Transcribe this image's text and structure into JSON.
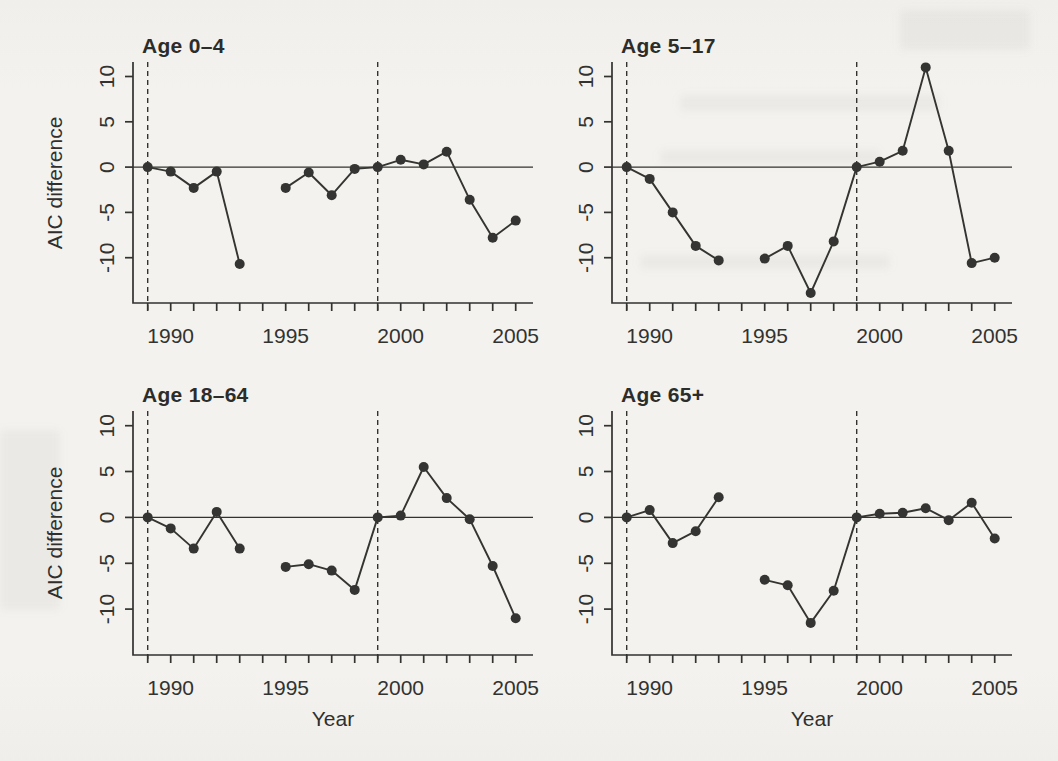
{
  "figure": {
    "ylabel": "AIC difference",
    "xlabel": "Year",
    "paper_color": "#f3f2ee",
    "ink_color": "#323230",
    "point_color": "#343432"
  },
  "chart_data": [
    {
      "type": "line",
      "title": "Age 0–4",
      "x": [
        1989,
        1990,
        1991,
        1992,
        1993,
        1994,
        1995,
        1996,
        1997,
        1998,
        1999,
        2000,
        2001,
        2002,
        2003,
        2004,
        2005
      ],
      "values": [
        0,
        -0.5,
        -2.3,
        -0.5,
        -10.7,
        null,
        -2.3,
        -0.6,
        -3.1,
        -0.2,
        0,
        0.8,
        0.3,
        1.7,
        -3.6,
        -7.8,
        -5.9
      ],
      "xlim": [
        1988.36,
        2005.75
      ],
      "ylim": [
        -15.0,
        11.6
      ],
      "x_ticks": [
        1989,
        1990,
        1991,
        1992,
        1993,
        1994,
        1995,
        1996,
        1997,
        1998,
        1999,
        2000,
        2001,
        2002,
        2003,
        2004,
        2005
      ],
      "x_tick_labels": [
        {
          "value": 1990,
          "label": "1990"
        },
        {
          "value": 1995,
          "label": "1995"
        },
        {
          "value": 2000,
          "label": "2000"
        },
        {
          "value": 2005,
          "label": "2005"
        }
      ],
      "y_ticks": [
        {
          "value": 10,
          "label": "10"
        },
        {
          "value": 5,
          "label": "5"
        },
        {
          "value": 0,
          "label": "0"
        },
        {
          "value": -5,
          "label": "-5"
        },
        {
          "value": -10,
          "label": "-10"
        }
      ],
      "vlines_dashed": [
        1989,
        1999
      ],
      "hline": 0,
      "grid": "off",
      "legend": "none"
    },
    {
      "type": "line",
      "title": "Age 5–17",
      "x": [
        1989,
        1990,
        1991,
        1992,
        1993,
        1994,
        1995,
        1996,
        1997,
        1998,
        1999,
        2000,
        2001,
        2002,
        2003,
        2004,
        2005
      ],
      "values": [
        0,
        -1.3,
        -5.0,
        -8.7,
        -10.3,
        null,
        -10.1,
        -8.7,
        -13.9,
        -8.2,
        0,
        0.6,
        1.8,
        11.0,
        1.8,
        -10.6,
        -10.0
      ],
      "xlim": [
        1988.36,
        2005.75
      ],
      "ylim": [
        -15.0,
        11.6
      ],
      "x_ticks": [
        1989,
        1990,
        1991,
        1992,
        1993,
        1994,
        1995,
        1996,
        1997,
        1998,
        1999,
        2000,
        2001,
        2002,
        2003,
        2004,
        2005
      ],
      "x_tick_labels": [
        {
          "value": 1990,
          "label": "1990"
        },
        {
          "value": 1995,
          "label": "1995"
        },
        {
          "value": 2000,
          "label": "2000"
        },
        {
          "value": 2005,
          "label": "2005"
        }
      ],
      "y_ticks": [
        {
          "value": 10,
          "label": "10"
        },
        {
          "value": 5,
          "label": "5"
        },
        {
          "value": 0,
          "label": "0"
        },
        {
          "value": -5,
          "label": "-5"
        },
        {
          "value": -10,
          "label": "-10"
        }
      ],
      "vlines_dashed": [
        1989,
        1999
      ],
      "hline": 0,
      "grid": "off",
      "legend": "none"
    },
    {
      "type": "line",
      "title": "Age 18–64",
      "x": [
        1989,
        1990,
        1991,
        1992,
        1993,
        1994,
        1995,
        1996,
        1997,
        1998,
        1999,
        2000,
        2001,
        2002,
        2003,
        2004,
        2005
      ],
      "values": [
        0,
        -1.2,
        -3.4,
        0.6,
        -3.4,
        null,
        -5.4,
        -5.1,
        -5.8,
        -7.9,
        0,
        0.2,
        5.5,
        2.1,
        -0.2,
        -5.3,
        -11.0
      ],
      "xlim": [
        1988.36,
        2005.75
      ],
      "ylim": [
        -15.0,
        11.6
      ],
      "x_ticks": [
        1989,
        1990,
        1991,
        1992,
        1993,
        1994,
        1995,
        1996,
        1997,
        1998,
        1999,
        2000,
        2001,
        2002,
        2003,
        2004,
        2005
      ],
      "x_tick_labels": [
        {
          "value": 1990,
          "label": "1990"
        },
        {
          "value": 1995,
          "label": "1995"
        },
        {
          "value": 2000,
          "label": "2000"
        },
        {
          "value": 2005,
          "label": "2005"
        }
      ],
      "y_ticks": [
        {
          "value": 10,
          "label": "10"
        },
        {
          "value": 5,
          "label": "5"
        },
        {
          "value": 0,
          "label": "0"
        },
        {
          "value": -5,
          "label": "-5"
        },
        {
          "value": -10,
          "label": "-10"
        }
      ],
      "vlines_dashed": [
        1989,
        1999
      ],
      "hline": 0,
      "grid": "off",
      "legend": "none"
    },
    {
      "type": "line",
      "title": "Age 65+",
      "x": [
        1989,
        1990,
        1991,
        1992,
        1993,
        1994,
        1995,
        1996,
        1997,
        1998,
        1999,
        2000,
        2001,
        2002,
        2003,
        2004,
        2005
      ],
      "values": [
        0,
        0.8,
        -2.8,
        -1.5,
        2.2,
        null,
        -6.8,
        -7.4,
        -11.5,
        -8.0,
        0,
        0.4,
        0.5,
        1.0,
        -0.3,
        1.6,
        -2.3
      ],
      "xlim": [
        1988.36,
        2005.75
      ],
      "ylim": [
        -15.0,
        11.6
      ],
      "x_ticks": [
        1989,
        1990,
        1991,
        1992,
        1993,
        1994,
        1995,
        1996,
        1997,
        1998,
        1999,
        2000,
        2001,
        2002,
        2003,
        2004,
        2005
      ],
      "x_tick_labels": [
        {
          "value": 1990,
          "label": "1990"
        },
        {
          "value": 1995,
          "label": "1995"
        },
        {
          "value": 2000,
          "label": "2000"
        },
        {
          "value": 2005,
          "label": "2005"
        }
      ],
      "y_ticks": [
        {
          "value": 10,
          "label": "10"
        },
        {
          "value": 5,
          "label": "5"
        },
        {
          "value": 0,
          "label": "0"
        },
        {
          "value": -5,
          "label": "-5"
        },
        {
          "value": -10,
          "label": "-10"
        }
      ],
      "vlines_dashed": [
        1989,
        1999
      ],
      "hline": 0,
      "grid": "off",
      "legend": "none"
    }
  ]
}
